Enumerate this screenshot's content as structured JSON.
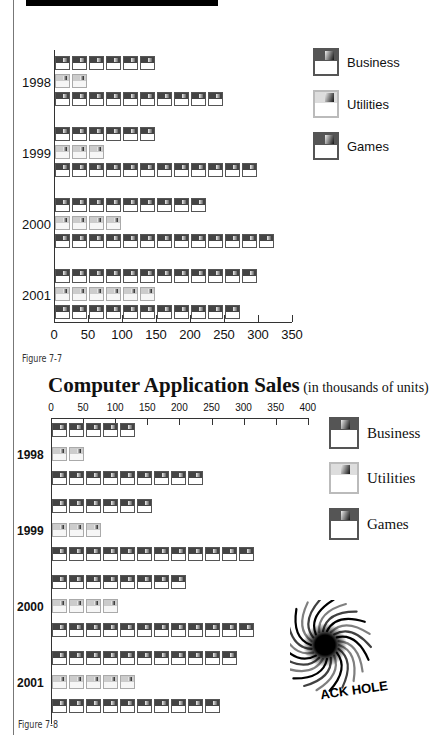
{
  "chart_data": [
    {
      "type": "bar",
      "orientation": "horizontal",
      "title": "",
      "caption": "Figure 7-7",
      "categories": [
        "1998",
        "1999",
        "2000",
        "2001"
      ],
      "series": [
        {
          "name": "Business",
          "values": [
            150,
            170,
            225,
            300
          ]
        },
        {
          "name": "Utilities",
          "values": [
            58,
            88,
            120,
            150
          ]
        },
        {
          "name": "Games",
          "values": [
            250,
            320,
            330,
            280
          ]
        }
      ],
      "xlabel": "",
      "ylabel": "",
      "xlim": [
        0,
        350
      ],
      "xticks": [
        "0",
        "50",
        "100",
        "150",
        "200",
        "250",
        "300",
        "350"
      ],
      "legend_position": "right",
      "grid": false
    },
    {
      "type": "bar",
      "orientation": "horizontal",
      "title": "Computer Application Sales",
      "subtitle": "(in thousands of units)",
      "caption": "Figure 7-8",
      "categories": [
        "1998",
        "1999",
        "2000",
        "2001"
      ],
      "series": [
        {
          "name": "Business",
          "values": [
            150,
            170,
            220,
            295
          ]
        },
        {
          "name": "Utilities",
          "values": [
            60,
            90,
            120,
            150
          ]
        },
        {
          "name": "Games",
          "values": [
            250,
            320,
            330,
            280
          ]
        }
      ],
      "xlabel": "",
      "ylabel": "",
      "xlim": [
        0,
        400
      ],
      "xticks": [
        "0",
        "50",
        "100",
        "150",
        "200",
        "250",
        "300",
        "350",
        "400"
      ],
      "legend_position": "right",
      "grid": false,
      "annotation": "BLACK HOLE"
    }
  ],
  "chart1": {
    "years": [
      "1998",
      "1999",
      "2000",
      "2001"
    ],
    "ticks": [
      "0",
      "50",
      "100",
      "150",
      "200",
      "250",
      "300",
      "350"
    ],
    "legend": [
      "Business",
      "Utilities",
      "Games"
    ],
    "caption": "Figure 7-7"
  },
  "chart2": {
    "title": "Computer Application Sales",
    "subtitle": " (in thousands of units)",
    "years": [
      "1998",
      "1999",
      "2000",
      "2001"
    ],
    "ticks": [
      "0",
      "50",
      "100",
      "150",
      "200",
      "250",
      "300",
      "350",
      "400"
    ],
    "legend": [
      "Business",
      "Utilities",
      "Games"
    ],
    "caption": "Figure 7-8",
    "logo_text": "ACK HOLE"
  },
  "colors": {
    "dark_disk": "#444444",
    "light_disk": "#cccccc",
    "axis": "#333333"
  }
}
